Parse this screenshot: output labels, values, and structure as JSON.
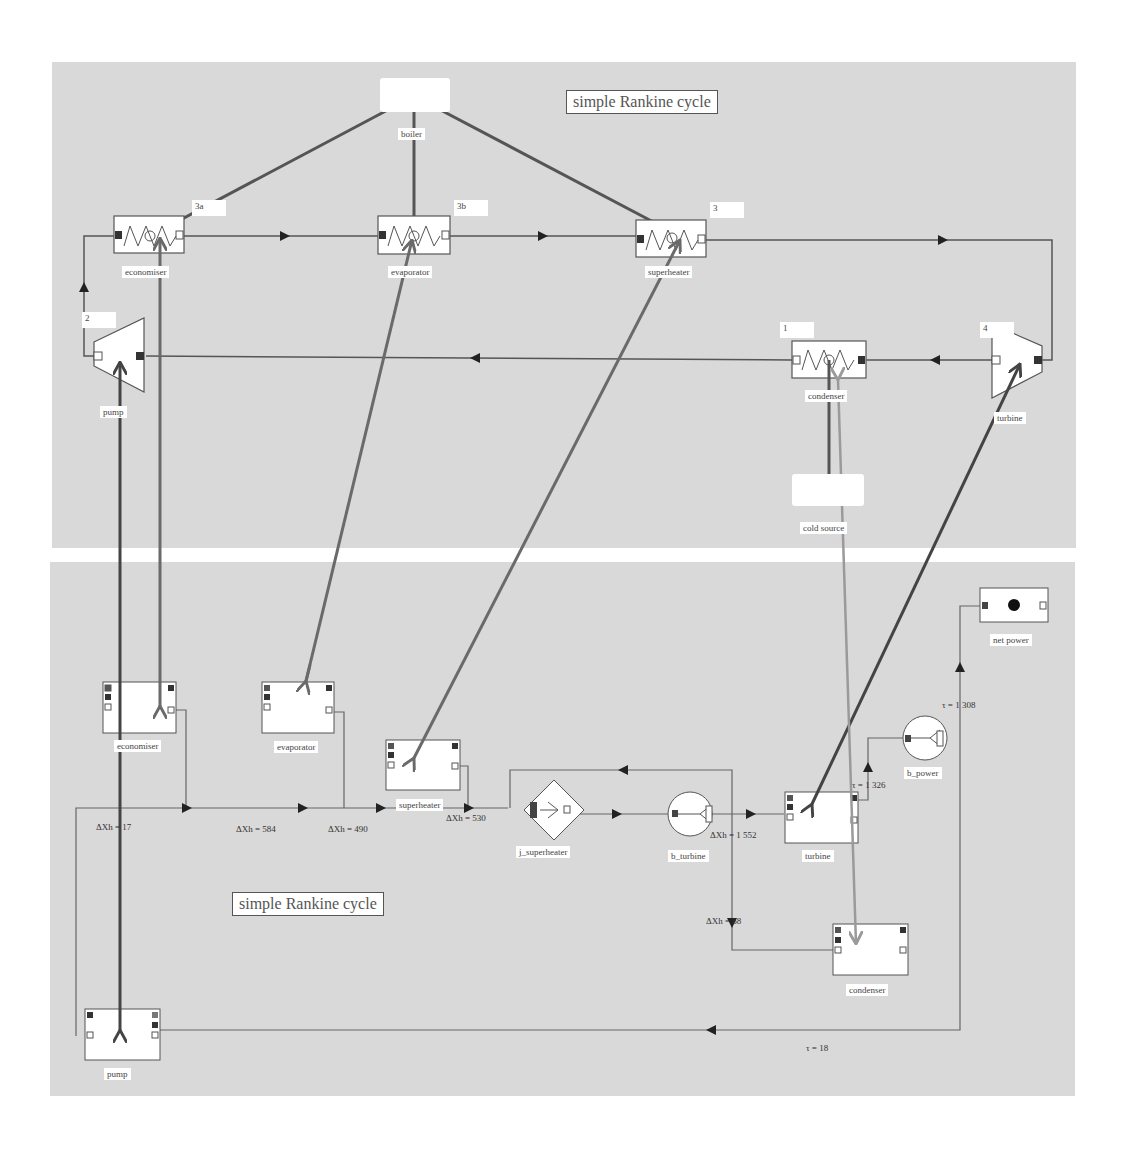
{
  "diagram_title_top": "simple Rankine cycle",
  "diagram_title_bottom": "simple Rankine cycle",
  "colors": {
    "panel_bg": "#d9d9d9",
    "line": "#555555",
    "thick_link_dark": "#444444",
    "thick_link_mid": "#6a6a6a",
    "thick_link_light": "#9a9a9a",
    "node_fill": "#ffffff",
    "port_filled": "#333333"
  },
  "top_diagram": {
    "boiler": {
      "label": "boiler"
    },
    "cold_source": {
      "label": "cold source"
    },
    "components": [
      {
        "id": "economiser",
        "label": "economiser",
        "point": "3a"
      },
      {
        "id": "evaporator",
        "label": "evaporator",
        "point": "3b"
      },
      {
        "id": "superheater",
        "label": "superheater",
        "point": "3"
      },
      {
        "id": "condenser",
        "label": "condenser",
        "point": "1"
      },
      {
        "id": "pump",
        "label": "pump",
        "point": "2"
      },
      {
        "id": "turbine",
        "label": "turbine",
        "point": "4"
      }
    ]
  },
  "bottom_diagram": {
    "components": [
      {
        "id": "economiser",
        "label": "economiser"
      },
      {
        "id": "evaporator",
        "label": "evaporator"
      },
      {
        "id": "superheater",
        "label": "superheater"
      },
      {
        "id": "j_superheater",
        "label": "j_superheater"
      },
      {
        "id": "b_turbine",
        "label": "b_turbine"
      },
      {
        "id": "turbine",
        "label": "turbine"
      },
      {
        "id": "b_power",
        "label": "b_power"
      },
      {
        "id": "net_power",
        "label": "net power"
      },
      {
        "id": "condenser",
        "label": "condenser"
      },
      {
        "id": "pump",
        "label": "pump"
      }
    ],
    "values": {
      "dxh_pump": "ΔXh = 17",
      "dxh_economiser": "ΔXh = 584",
      "dxh_evaporator": "ΔXh = 490",
      "dxh_superheater": "ΔXh = 530",
      "dxh_turbine": "ΔXh = 1 552",
      "dxh_condenser": "ΔXh = 68",
      "tau_turbine": "τ = 1 326",
      "tau_net": "τ = 1 308",
      "tau_pump": "τ = 18"
    }
  }
}
